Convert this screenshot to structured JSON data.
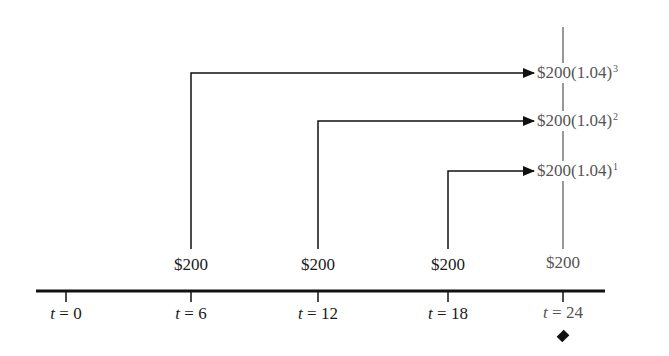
{
  "diagram": {
    "type": "cash-flow timeline",
    "axis": {
      "ticks": [
        {
          "var": "t",
          "eq": "=",
          "value": "0"
        },
        {
          "var": "t",
          "eq": "=",
          "value": "6"
        },
        {
          "var": "t",
          "eq": "=",
          "value": "12"
        },
        {
          "var": "t",
          "eq": "=",
          "value": "18"
        },
        {
          "var": "t",
          "eq": "=",
          "value": "24"
        }
      ],
      "marker": "diamond-icon under t = 24"
    },
    "payments": [
      {
        "label": "$200",
        "at": "t = 6"
      },
      {
        "label": "$200",
        "at": "t = 12"
      },
      {
        "label": "$200",
        "at": "t = 18"
      },
      {
        "label": "$200",
        "at": "t = 24"
      }
    ],
    "future_values": [
      {
        "base": "$200(1.04)",
        "exp": "3",
        "from": "t = 6"
      },
      {
        "base": "$200(1.04)",
        "exp": "2",
        "from": "t = 12"
      },
      {
        "base": "$200(1.04)",
        "exp": "1",
        "from": "t = 18"
      }
    ]
  }
}
